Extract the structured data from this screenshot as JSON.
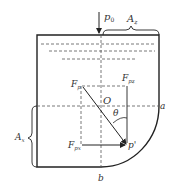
{
  "diagram": {
    "colors": {
      "stroke": "#222222",
      "dashed": "#555555",
      "text": "#333333",
      "background": "#ffffff"
    },
    "labels": {
      "p0": {
        "main": "p",
        "sub": "0"
      },
      "Az": {
        "main": "A",
        "sub": "z"
      },
      "Ax": {
        "main": "A",
        "sub": "x"
      },
      "Fp": {
        "main": "F",
        "sub": "p"
      },
      "Fpz": {
        "main": "F",
        "sub": "pz"
      },
      "Fpx": {
        "main": "F",
        "sub": "px"
      },
      "O": "O",
      "theta": "θ",
      "a": "a",
      "b": "b",
      "pprime": "p'"
    }
  }
}
